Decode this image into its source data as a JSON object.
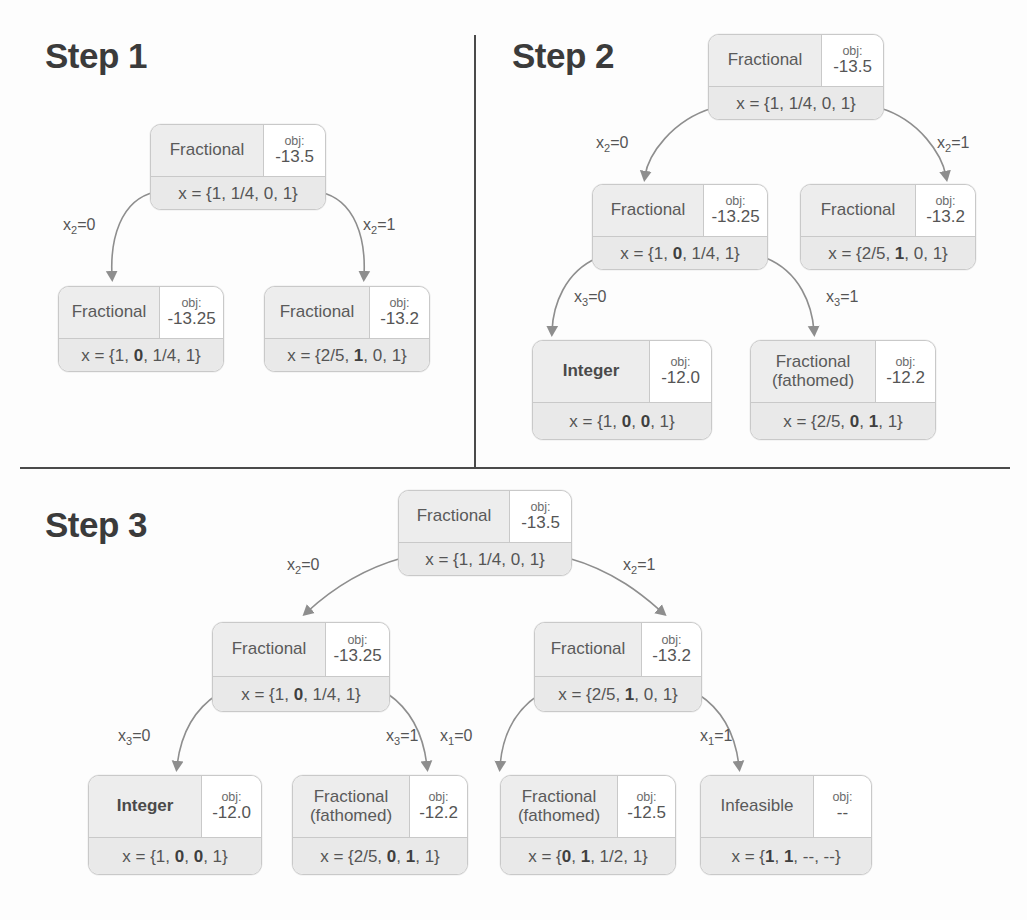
{
  "panels": [
    {
      "id": "step1",
      "title": "Step 1"
    },
    {
      "id": "step2",
      "title": "Step 2"
    },
    {
      "id": "step3",
      "title": "Step 3"
    }
  ],
  "obj_label": "obj:",
  "nodes": {
    "s1_root": {
      "status": "Fractional",
      "status2": "",
      "obj": "-13.5",
      "x": "x = {1, 1/4, 0, 1}"
    },
    "s1_left": {
      "status": "Fractional",
      "status2": "",
      "obj": "-13.25",
      "x": "x = {1, 0, 1/4, 1}"
    },
    "s1_right": {
      "status": "Fractional",
      "status2": "",
      "obj": "-13.2",
      "x": "x = {2/5, 1, 0, 1}"
    },
    "s2_root": {
      "status": "Fractional",
      "status2": "",
      "obj": "-13.5",
      "x": "x = {1, 1/4, 0, 1}"
    },
    "s2_left": {
      "status": "Fractional",
      "status2": "",
      "obj": "-13.25",
      "x": "x = {1, 0, 1/4, 1}"
    },
    "s2_right": {
      "status": "Fractional",
      "status2": "",
      "obj": "-13.2",
      "x": "x = {2/5, 1, 0, 1}"
    },
    "s2_ll": {
      "status": "Integer",
      "status2": "",
      "obj": "-12.0",
      "x": "x = {1, 0, 0, 1}"
    },
    "s2_lr": {
      "status": "Fractional",
      "status2": "(fathomed)",
      "obj": "-12.2",
      "x": "x = {2/5, 0, 1, 1}"
    },
    "s3_root": {
      "status": "Fractional",
      "status2": "",
      "obj": "-13.5",
      "x": "x = {1, 1/4, 0, 1}"
    },
    "s3_left": {
      "status": "Fractional",
      "status2": "",
      "obj": "-13.25",
      "x": "x = {1, 0, 1/4, 1}"
    },
    "s3_right": {
      "status": "Fractional",
      "status2": "",
      "obj": "-13.2",
      "x": "x = {2/5, 1, 0, 1}"
    },
    "s3_ll": {
      "status": "Integer",
      "status2": "",
      "obj": "-12.0",
      "x": "x = {1, 0, 0, 1}"
    },
    "s3_lr": {
      "status": "Fractional",
      "status2": "(fathomed)",
      "obj": "-12.2",
      "x": "x = {2/5, 0, 1, 1}"
    },
    "s3_rl": {
      "status": "Fractional",
      "status2": "(fathomed)",
      "obj": "-12.5",
      "x": "x = {0, 1, 1/2, 1}"
    },
    "s3_rr": {
      "status": "Infeasible",
      "status2": "",
      "obj": "--",
      "x": "x = {1, 1, --, --}"
    }
  },
  "edge_labels": {
    "s1_l": {
      "var": "x",
      "sub": "2",
      "val": "=0"
    },
    "s1_r": {
      "var": "x",
      "sub": "2",
      "val": "=1"
    },
    "s2_l": {
      "var": "x",
      "sub": "2",
      "val": "=0"
    },
    "s2_r": {
      "var": "x",
      "sub": "2",
      "val": "=1"
    },
    "s2_ll": {
      "var": "x",
      "sub": "3",
      "val": "=0"
    },
    "s2_lr": {
      "var": "x",
      "sub": "3",
      "val": "=1"
    },
    "s3_l": {
      "var": "x",
      "sub": "2",
      "val": "=0"
    },
    "s3_r": {
      "var": "x",
      "sub": "2",
      "val": "=1"
    },
    "s3_ll": {
      "var": "x",
      "sub": "3",
      "val": "=0"
    },
    "s3_lr": {
      "var": "x",
      "sub": "3",
      "val": "=1"
    },
    "s3_rl": {
      "var": "x",
      "sub": "1",
      "val": "=0"
    },
    "s3_rr": {
      "var": "x",
      "sub": "1",
      "val": "=1"
    }
  },
  "colors": {
    "node_border": "#c9c9c9",
    "cell_shade": "#ededed",
    "bottom_shade": "#e9e9e9",
    "text": "#555555",
    "title": "#3b3b3b",
    "divider": "#4a4a4a",
    "arrow": "#8a8a8a"
  }
}
